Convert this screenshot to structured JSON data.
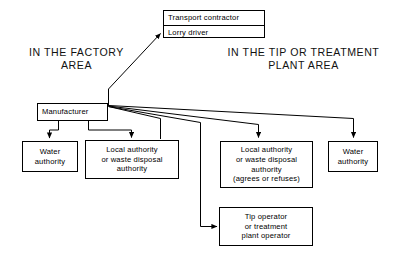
{
  "diagram": {
    "type": "flow-diagram",
    "colors": {
      "stroke": "#000000",
      "background": "#ffffff",
      "text": "#000000"
    },
    "headings": [
      {
        "id": "factory-area",
        "lines": [
          "IN THE FACTORY",
          "AREA"
        ]
      },
      {
        "id": "tip-or-treatment-plant-area",
        "lines": [
          "IN THE TIP OR TREATMENT",
          "PLANT AREA"
        ]
      }
    ],
    "nodes": [
      {
        "id": "transport-contractor",
        "kind": "split",
        "cells": [
          "Transport contractor",
          "Lorry driver"
        ]
      },
      {
        "id": "manufacturer",
        "kind": "plain",
        "lines": [
          "Manufacturer"
        ]
      },
      {
        "id": "water-authority-left",
        "kind": "plain",
        "lines": [
          "Water",
          "authority"
        ]
      },
      {
        "id": "local-authority-left",
        "kind": "plain",
        "lines": [
          "Local authority",
          "or waste disposal",
          "authority"
        ]
      },
      {
        "id": "local-authority-right",
        "kind": "plain",
        "lines": [
          "Local authority",
          "or waste disposal",
          "authority",
          "(agrees or refuses)"
        ]
      },
      {
        "id": "water-authority-right",
        "kind": "plain",
        "lines": [
          "Water",
          "authority"
        ]
      },
      {
        "id": "tip-operator",
        "kind": "plain",
        "lines": [
          "Tip operator",
          "or treatment",
          "plant operator"
        ]
      }
    ],
    "edges": [
      {
        "id": "manufacturer-to-transport-contractor",
        "from": "manufacturer",
        "to": "transport-contractor",
        "arrow": true
      },
      {
        "id": "manufacturer-to-water-authority-left",
        "from": "manufacturer",
        "to": "water-authority-left",
        "arrow": true
      },
      {
        "id": "manufacturer-to-local-authority-left",
        "from": "manufacturer",
        "to": "local-authority-left",
        "arrow": true
      },
      {
        "id": "manufacturer-to-local-authority-right",
        "from": "manufacturer",
        "to": "local-authority-right",
        "arrow": true
      },
      {
        "id": "manufacturer-to-water-authority-right",
        "from": "manufacturer",
        "to": "water-authority-right",
        "arrow": true
      },
      {
        "id": "manufacturer-to-tip-operator",
        "from": "manufacturer",
        "to": "tip-operator",
        "arrow": true
      }
    ]
  }
}
